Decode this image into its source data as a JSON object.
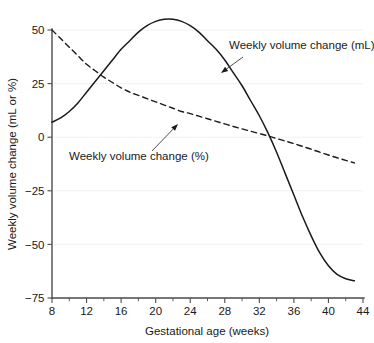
{
  "chart_data": {
    "type": "line",
    "title": "",
    "subtitle": "",
    "xlabel": "Gestational age (weeks)",
    "ylabel": "Weekly volume change (mL or %)",
    "xlim": [
      8,
      44
    ],
    "ylim": [
      -75,
      50
    ],
    "xticks": [
      8,
      12,
      16,
      20,
      24,
      28,
      32,
      36,
      40,
      44
    ],
    "xtick_labels": [
      "8",
      "12",
      "16",
      "20",
      "24",
      "28",
      "32",
      "36",
      "40",
      "44"
    ],
    "xminor_ticks": [
      10,
      14,
      18,
      22,
      26,
      30,
      34,
      38,
      42
    ],
    "yticks": [
      50,
      25,
      0,
      -25,
      -50,
      -75
    ],
    "ytick_labels": [
      "50",
      "25",
      "0",
      "−25",
      "−50",
      "−75"
    ],
    "grid": "horizontal-faint",
    "legend": "annotations",
    "legend_position": "inline-annotations",
    "series": [
      {
        "name": "Weekly volume change (mL)",
        "style": "solid",
        "color": "#1a1a1a",
        "x": [
          8,
          9,
          10,
          11,
          12,
          13,
          14,
          15,
          16,
          17,
          18,
          19,
          20,
          21,
          22,
          23,
          24,
          25,
          26,
          27,
          28,
          29,
          30,
          31,
          32,
          33,
          34,
          35,
          36,
          37,
          38,
          39,
          40,
          41,
          42,
          43
        ],
        "values": [
          7,
          9,
          12,
          16,
          21,
          26,
          31,
          36,
          41,
          45,
          49,
          52,
          54,
          55,
          55,
          54,
          52,
          49,
          45,
          41,
          36,
          30,
          24,
          17,
          10,
          2,
          -7,
          -17,
          -27,
          -37,
          -46,
          -54,
          -60,
          -64,
          -66,
          -67
        ]
      },
      {
        "name": "Weekly volume change (%)",
        "style": "dashed",
        "color": "#1a1a1a",
        "x": [
          8,
          9,
          10,
          11,
          12,
          13,
          14,
          15,
          16,
          17,
          18,
          19,
          20,
          21,
          22,
          23,
          24,
          25,
          26,
          27,
          28,
          29,
          30,
          31,
          32,
          33,
          34,
          35,
          36,
          37,
          38,
          39,
          40,
          41,
          42,
          43
        ],
        "values": [
          50,
          46,
          42,
          38,
          34,
          31,
          28,
          25.5,
          23,
          21,
          19.5,
          18,
          16.5,
          15,
          13.5,
          12,
          11,
          9.8,
          8.6,
          7.4,
          6.2,
          5,
          3.9,
          2.8,
          1.7,
          0.6,
          -0.6,
          -1.8,
          -3,
          -4.3,
          -5.6,
          -7,
          -8.3,
          -9.6,
          -10.8,
          -12
        ]
      }
    ],
    "annotations": [
      {
        "text": "Weekly volume change (mL)",
        "text_x": 229,
        "text_y": 49,
        "arrow_from_x": 243,
        "arrow_from_y": 57,
        "arrow_to_x": 221,
        "arrow_to_y": 73
      },
      {
        "text": "Weekly volume change (%)",
        "text_x": 69,
        "text_y": 160,
        "arrow_from_x": 152,
        "arrow_from_y": 151,
        "arrow_to_x": 178,
        "arrow_to_y": 124
      }
    ]
  },
  "plot_geometry": {
    "x_origin_px": 52,
    "x_end_px": 363,
    "y_top_px": 30,
    "y_bottom_px": 298,
    "y_zero_px": 137
  },
  "colors": {
    "line": "#1a1a1a",
    "axis": "#4d4d4d",
    "grid": "#f2f2f4",
    "background": "#ffffff"
  }
}
